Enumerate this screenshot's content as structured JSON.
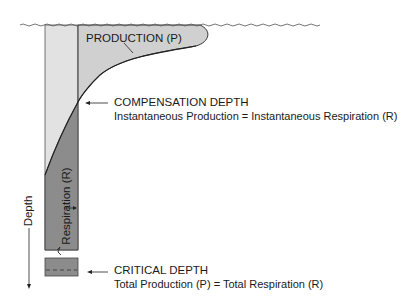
{
  "diagram": {
    "production_label": "PRODUCTION (P)",
    "respiration_label": "Respiration (R)",
    "depth_label": "Depth",
    "compensation": {
      "title": "COMPENSATION DEPTH",
      "description": "Instantaneous Production = Instantaneous Respiration (R)"
    },
    "critical": {
      "title": "CRITICAL DEPTH",
      "description": "Total Production (P) = Total Respiration (R)"
    },
    "colors": {
      "light_fill": "#d9d9d9",
      "column_fill": "#e2e2e2",
      "dark_fill": "#8c8c8c",
      "outline": "#3a3a3a"
    }
  }
}
